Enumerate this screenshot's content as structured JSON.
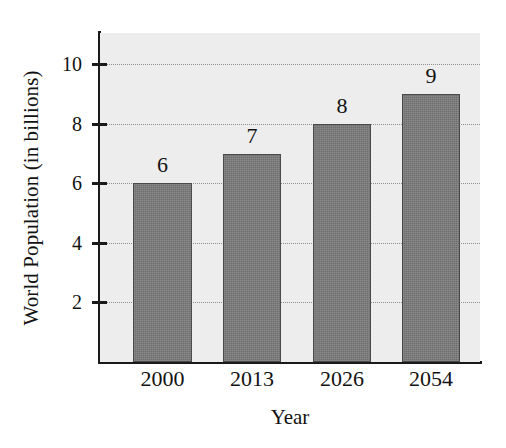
{
  "chart_data": {
    "type": "bar",
    "title": "",
    "subtitle": "",
    "xlabel": "Year",
    "ylabel": "World Population (in billions)",
    "categories": [
      "2000",
      "2013",
      "2026",
      "2054"
    ],
    "values": [
      6,
      7,
      8,
      9
    ],
    "value_labels": [
      "6",
      "7",
      "8",
      "9"
    ],
    "series": [
      {
        "name": "World Population",
        "values": [
          6,
          7,
          8,
          9
        ]
      }
    ],
    "ylim": [
      0,
      11.05
    ],
    "xlim": [
      0,
      4
    ],
    "yticks": [
      2,
      4,
      6,
      8,
      10
    ],
    "ytick_labels": [
      "2",
      "4",
      "6",
      "8",
      "10"
    ],
    "grid": true,
    "grid_axis": "y",
    "grid_style": "dotted",
    "legend": false,
    "legend_position": "none",
    "bar_color": "#6f6f6f",
    "bar_edge_color": "#4a4a4a",
    "plot_background": "#ededed",
    "figure_background": "#ffffff",
    "axis_color": "#1a1a1a",
    "text_color": "#121212",
    "gridline_color": "#8f8f8f",
    "annotations": []
  }
}
